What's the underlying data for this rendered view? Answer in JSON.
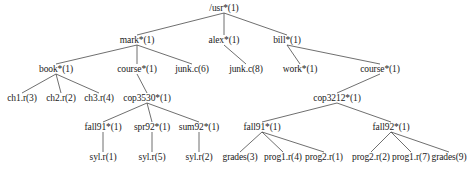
{
  "figure": {
    "name": "unix-directory-tree",
    "width": 469,
    "height": 172,
    "background_color": "#ffffff",
    "edge_color": "#4a4a4a",
    "text_color": "#1a1a1a"
  },
  "nodes": [
    {
      "id": "usr",
      "label": "/usr*(1)",
      "x": 224,
      "y": 8,
      "type": "directory"
    },
    {
      "id": "mark",
      "label": "mark*(1)",
      "x": 137,
      "y": 40,
      "type": "directory"
    },
    {
      "id": "alex",
      "label": "alex*(1)",
      "x": 224,
      "y": 40,
      "type": "directory"
    },
    {
      "id": "bill",
      "label": "bill*(1)",
      "x": 287,
      "y": 40,
      "type": "directory"
    },
    {
      "id": "book",
      "label": "book*(1)",
      "x": 56,
      "y": 69,
      "type": "directory"
    },
    {
      "id": "course_mark",
      "label": "course*(1)",
      "x": 137,
      "y": 69,
      "type": "directory"
    },
    {
      "id": "junkc6",
      "label": "junk.c(6)",
      "x": 192,
      "y": 69,
      "type": "file"
    },
    {
      "id": "junkc8",
      "label": "junk.c(8)",
      "x": 246,
      "y": 69,
      "type": "file"
    },
    {
      "id": "work",
      "label": "work*(1)",
      "x": 300,
      "y": 69,
      "type": "directory"
    },
    {
      "id": "course_bill",
      "label": "course*(1)",
      "x": 380,
      "y": 69,
      "type": "directory"
    },
    {
      "id": "ch1r",
      "label": "ch1.r(3)",
      "x": 22,
      "y": 98,
      "type": "file"
    },
    {
      "id": "ch2r",
      "label": "ch2.r(2)",
      "x": 61,
      "y": 98,
      "type": "file"
    },
    {
      "id": "ch3r",
      "label": "ch3.r(4)",
      "x": 99,
      "y": 98,
      "type": "file"
    },
    {
      "id": "cop3530",
      "label": "cop3530*(1)",
      "x": 147,
      "y": 98,
      "type": "directory"
    },
    {
      "id": "cop3212",
      "label": "cop3212*(1)",
      "x": 337,
      "y": 98,
      "type": "directory"
    },
    {
      "id": "fall91_3530",
      "label": "fall91*(1)",
      "x": 103,
      "y": 127,
      "type": "directory"
    },
    {
      "id": "spr92",
      "label": "spr92*(1)",
      "x": 152,
      "y": 127,
      "type": "directory"
    },
    {
      "id": "sum92",
      "label": "sum92*(1)",
      "x": 199,
      "y": 127,
      "type": "directory"
    },
    {
      "id": "fall91_3212",
      "label": "fall91*(1)",
      "x": 262,
      "y": 127,
      "type": "directory"
    },
    {
      "id": "fall92_3212",
      "label": "fall92*(1)",
      "x": 391,
      "y": 127,
      "type": "directory"
    },
    {
      "id": "sylr1",
      "label": "syl.r(1)",
      "x": 103,
      "y": 157,
      "type": "file"
    },
    {
      "id": "sylr5",
      "label": "syl.r(5)",
      "x": 152,
      "y": 157,
      "type": "file"
    },
    {
      "id": "sylr2",
      "label": "syl.r(2)",
      "x": 199,
      "y": 157,
      "type": "file"
    },
    {
      "id": "grades3",
      "label": "grades(3)",
      "x": 240,
      "y": 157,
      "type": "file"
    },
    {
      "id": "prog1r4",
      "label": "prog1.r(4)",
      "x": 283,
      "y": 157,
      "type": "file"
    },
    {
      "id": "prog2r1",
      "label": "prog2.r(1)",
      "x": 324,
      "y": 157,
      "type": "file"
    },
    {
      "id": "prog2r2",
      "label": "prog2.r(2)",
      "x": 371,
      "y": 157,
      "type": "file"
    },
    {
      "id": "prog1r7",
      "label": "prog1.r(7)",
      "x": 411,
      "y": 157,
      "type": "file"
    },
    {
      "id": "grades9",
      "label": "grades(9)",
      "x": 449,
      "y": 157,
      "type": "file"
    }
  ],
  "edges": [
    {
      "from": "usr",
      "to": "mark"
    },
    {
      "from": "usr",
      "to": "alex"
    },
    {
      "from": "usr",
      "to": "bill"
    },
    {
      "from": "mark",
      "to": "book"
    },
    {
      "from": "mark",
      "to": "course_mark"
    },
    {
      "from": "mark",
      "to": "junkc6"
    },
    {
      "from": "alex",
      "to": "junkc8"
    },
    {
      "from": "bill",
      "to": "work"
    },
    {
      "from": "bill",
      "to": "course_bill"
    },
    {
      "from": "book",
      "to": "ch1r"
    },
    {
      "from": "book",
      "to": "ch2r"
    },
    {
      "from": "book",
      "to": "ch3r"
    },
    {
      "from": "course_mark",
      "to": "cop3530"
    },
    {
      "from": "course_bill",
      "to": "cop3212"
    },
    {
      "from": "cop3530",
      "to": "fall91_3530"
    },
    {
      "from": "cop3530",
      "to": "spr92"
    },
    {
      "from": "cop3530",
      "to": "sum92"
    },
    {
      "from": "cop3212",
      "to": "fall91_3212"
    },
    {
      "from": "cop3212",
      "to": "fall92_3212"
    },
    {
      "from": "fall91_3530",
      "to": "sylr1"
    },
    {
      "from": "spr92",
      "to": "sylr5"
    },
    {
      "from": "sum92",
      "to": "sylr2"
    },
    {
      "from": "fall91_3212",
      "to": "grades3"
    },
    {
      "from": "fall91_3212",
      "to": "prog1r4"
    },
    {
      "from": "fall91_3212",
      "to": "prog2r1"
    },
    {
      "from": "fall92_3212",
      "to": "prog2r2"
    },
    {
      "from": "fall92_3212",
      "to": "prog1r7"
    },
    {
      "from": "fall92_3212",
      "to": "grades9"
    }
  ]
}
